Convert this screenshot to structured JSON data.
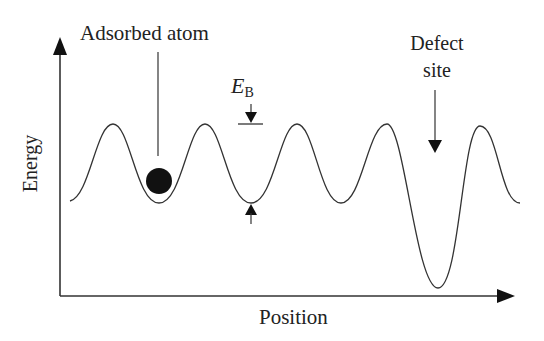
{
  "diagram": {
    "axes": {
      "x_label": "Position",
      "y_label": "Energy"
    },
    "labels": {
      "adsorbed_atom": "Adsorbed atom",
      "barrier_symbol": "E",
      "barrier_subscript": "B",
      "defect_line1": "Defect",
      "defect_line2": "site"
    },
    "colors": {
      "stroke": "#333333",
      "atom": "#111111",
      "background": "#ffffff"
    },
    "curve": {
      "peak_count": 5,
      "regular_wells": 3,
      "defect_wells": 1,
      "peak_y": 124,
      "well_y": 203,
      "defect_well_y": 288
    }
  }
}
